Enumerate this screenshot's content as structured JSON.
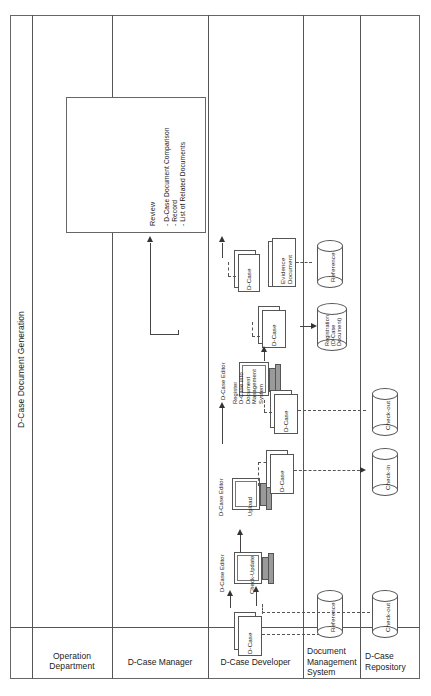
{
  "diagram": {
    "type": "swimlane-activity-diagram",
    "orientation": "rotated-90-ccw",
    "phase_label": "D-Case Document Generation",
    "lanes": [
      {
        "id": "operation-department",
        "label": "Operation\nDepartment"
      },
      {
        "id": "d-case-manager",
        "label": "D-Case Manager"
      },
      {
        "id": "d-case-developer",
        "label": "D-Case Developer"
      },
      {
        "id": "document-management-system",
        "label": "Document\nManagement\nSystem"
      },
      {
        "id": "d-case-repository",
        "label": "D-Case\nRepository"
      }
    ],
    "review_box": {
      "title": "Review",
      "items": [
        "- D-Case Document Comparison",
        "- Record",
        "- List of Related Documents"
      ]
    },
    "editors": [
      {
        "id": "editor-register",
        "title": "D-Case Editor",
        "action": "Register\nD-Case into\nDocument\nManagement\nSystem"
      },
      {
        "id": "editor-upload",
        "title": "D-Case Editor",
        "action": "Upload"
      },
      {
        "id": "editor-check-update",
        "title": "D-Case Editor",
        "action": "Check-Update"
      }
    ],
    "documents": [
      {
        "id": "doc-dcase-review",
        "label": "D-Case"
      },
      {
        "id": "doc-evidence",
        "label": "Evidence\nDocument"
      },
      {
        "id": "doc-dcase-register",
        "label": "D-Case"
      },
      {
        "id": "doc-dcase-checkout",
        "label": "D-Case"
      },
      {
        "id": "doc-dcase-checkin",
        "label": "D-Case"
      },
      {
        "id": "doc-dcase-initial",
        "label": "D-Case"
      }
    ],
    "datastores": [
      {
        "id": "dms-reference-top",
        "label": "Reference",
        "lane": "document-management-system"
      },
      {
        "id": "dms-registration",
        "label": "Registration\n(D-Case\nDocument)",
        "lane": "document-management-system"
      },
      {
        "id": "dms-reference-bottom",
        "label": "Reference",
        "lane": "document-management-system"
      },
      {
        "id": "repo-check-out",
        "label": "Check-out",
        "lane": "d-case-repository"
      },
      {
        "id": "repo-check-in",
        "label": "Check-in",
        "lane": "d-case-repository"
      },
      {
        "id": "repo-check-out-bottom",
        "label": "Check-out",
        "lane": "d-case-repository"
      }
    ],
    "colors": {
      "line": "#555555",
      "frame": "#666666",
      "text": "#1a1a1a",
      "background": "#ffffff",
      "arrow": "#333333"
    }
  }
}
